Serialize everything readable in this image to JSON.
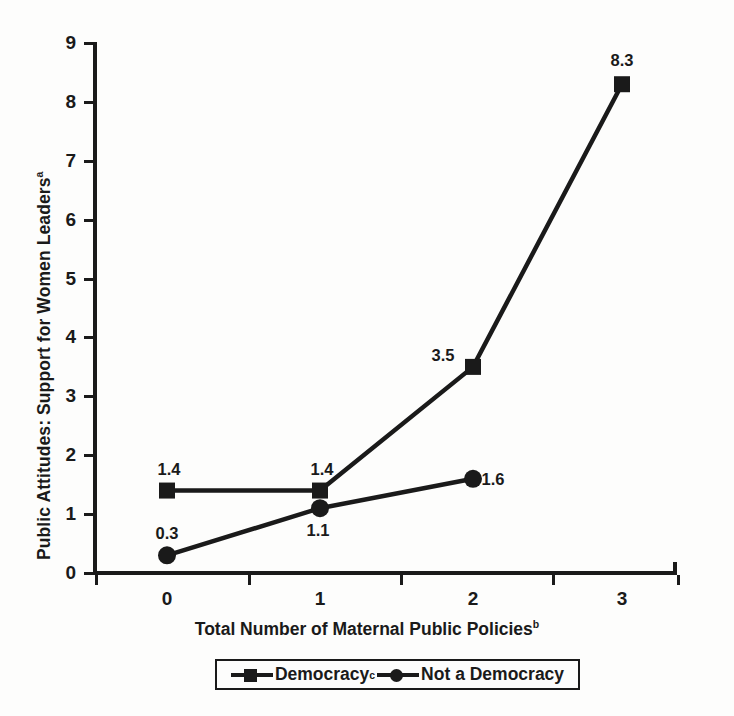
{
  "chart_data": {
    "type": "line",
    "title": "",
    "xlabel": "Total Number of Maternal Public Policies",
    "xlabel_sup": "b",
    "ylabel": "Public Attitudes: Support for Women Leaders",
    "ylabel_sup": "a",
    "categories": [
      "0",
      "1",
      "2",
      "3"
    ],
    "x": [
      0,
      1,
      2,
      3
    ],
    "ylim": [
      0,
      9
    ],
    "yticks": [
      0,
      1,
      2,
      3,
      4,
      5,
      6,
      7,
      8,
      9
    ],
    "ytick_labels": [
      "0",
      "1",
      "2",
      "3",
      "4",
      "5",
      "6",
      "7",
      "8",
      "9"
    ],
    "grid": false,
    "legend_position": "below-axis-centered",
    "series": [
      {
        "name": "Democracy",
        "name_sup": "c",
        "marker": "square",
        "color": "#1a1a1a",
        "x": [
          0,
          1,
          2,
          3
        ],
        "values": [
          1.4,
          1.4,
          3.5,
          8.3
        ],
        "point_labels": [
          "1.4",
          "1.4",
          "3.5",
          "8.3"
        ]
      },
      {
        "name": "Not a Democracy",
        "name_sup": "",
        "marker": "circle",
        "color": "#1a1a1a",
        "x": [
          0,
          1,
          2
        ],
        "values": [
          0.3,
          1.1,
          1.6
        ],
        "point_labels": [
          "0.3",
          "1.1",
          "1.6"
        ]
      }
    ]
  },
  "axes": {
    "y_title_text": "Public Attitudes: Support for Women Leaders",
    "y_title_sup": "a",
    "x_title_text": "Total Number of Maternal Public Policies",
    "x_title_sup": "b",
    "ytick_labels": [
      "9",
      "8",
      "7",
      "6",
      "5",
      "4",
      "3",
      "2",
      "1",
      "0"
    ],
    "xtick_labels": [
      "0",
      "1",
      "2",
      "3"
    ]
  },
  "legend": {
    "entries": [
      {
        "label": "Democracy",
        "sup": "c",
        "marker": "square"
      },
      {
        "label": "Not a Democracy",
        "sup": "",
        "marker": "circle"
      }
    ]
  },
  "point_labels": {
    "democracy": [
      "1.4",
      "1.4",
      "3.5",
      "8.3"
    ],
    "not_a_democracy": [
      "0.3",
      "1.1",
      "1.6"
    ]
  },
  "colors": {
    "ink": "#1a1a1a",
    "background": "#fdfdfc"
  }
}
